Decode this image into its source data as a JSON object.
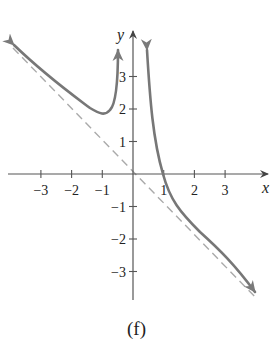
{
  "caption": "(f)",
  "chart_data": {
    "type": "line",
    "title": "",
    "xlabel": "x",
    "ylabel": "y",
    "xlim": [
      -4.2,
      4.5
    ],
    "ylim": [
      -4,
      4.6
    ],
    "x_ticks": [
      -3,
      -2,
      -1,
      1,
      2,
      3
    ],
    "y_ticks": [
      -3,
      -2,
      -1,
      1,
      2,
      3
    ],
    "x_tick_labels": [
      "−3",
      "−2",
      "−1",
      "1",
      "2",
      "3"
    ],
    "y_tick_labels": [
      "−3",
      "−2",
      "−1",
      "1",
      "2",
      "3"
    ],
    "grid": false,
    "legend": null,
    "vertical_asymptote": 0,
    "slant_asymptote": {
      "equation": "y = -x",
      "style": "dashed"
    },
    "series": [
      {
        "name": "left branch",
        "x": [
          -4.2,
          -3.5,
          -3,
          -2.5,
          -2,
          -1.5,
          -1.2,
          -1,
          -0.8,
          -0.6,
          -0.45,
          -0.35
        ],
        "values": [
          3.9,
          3.2,
          2.75,
          2.4,
          2.05,
          1.85,
          1.8,
          1.87,
          2.1,
          2.6,
          3.2,
          3.7
        ],
        "arrows": [
          "start",
          "end"
        ]
      },
      {
        "name": "right branch",
        "x": [
          0.32,
          0.4,
          0.55,
          0.7,
          0.85,
          1,
          1.3,
          1.7,
          2.2,
          3,
          3.8,
          4.3
        ],
        "values": [
          3.9,
          3.0,
          1.8,
          1.0,
          0.45,
          0.0,
          -0.6,
          -1.2,
          -1.85,
          -2.8,
          -3.6,
          -4.1
        ],
        "arrows": [
          "start",
          "end"
        ]
      }
    ],
    "colors": {
      "curve": "#777777",
      "asymptote": "#aaaaaa",
      "axes": "#555555"
    }
  }
}
